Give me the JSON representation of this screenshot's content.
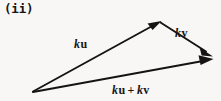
{
  "figure": {
    "enumeration_label": "(ii)",
    "background_color": "#f8f7f5",
    "stroke_color": "#141414",
    "width": 221,
    "height": 101
  },
  "labels": {
    "ku": {
      "scalar": "k",
      "vector": "u"
    },
    "kv": {
      "scalar": "k",
      "vector": "v"
    },
    "sum": {
      "scalar_1": "k",
      "vector_1": "u",
      "operator": "+",
      "scalar_2": "k",
      "vector_2": "v"
    }
  },
  "vectors": [
    {
      "name": "ku",
      "label": "ku",
      "from": [
        32,
        92
      ],
      "to": [
        160,
        22
      ],
      "arrowhead": true
    },
    {
      "name": "kv",
      "label": "kv",
      "from": [
        160,
        22
      ],
      "to": [
        213,
        56
      ],
      "arrowhead": true
    },
    {
      "name": "ku-plus-kv",
      "label": "ku + kv",
      "from": [
        32,
        92
      ],
      "to": [
        213,
        60
      ],
      "arrowhead": true
    }
  ]
}
